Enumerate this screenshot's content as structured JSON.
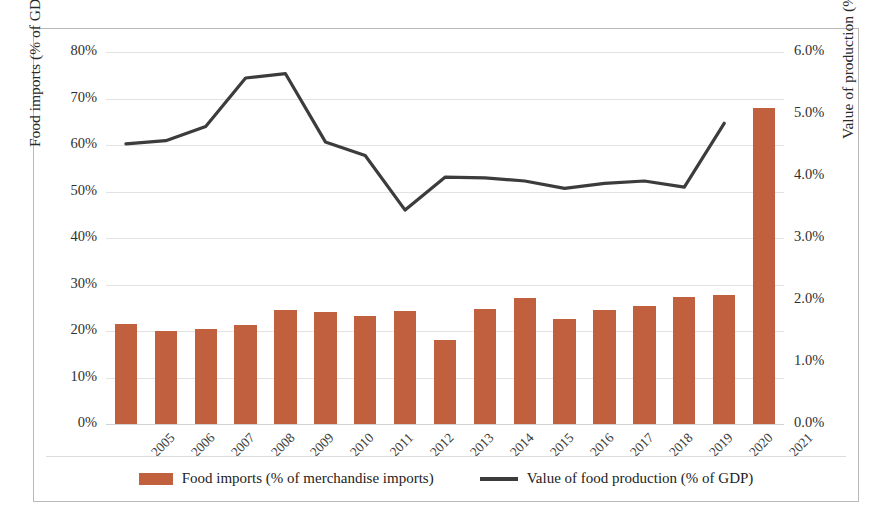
{
  "axes": {
    "y_left_title": "Food imports (% of GDP)",
    "y_right_title": "Value of production (% of GDP)",
    "y_left_ticks": [
      "0%",
      "10%",
      "20%",
      "30%",
      "40%",
      "50%",
      "60%",
      "70%",
      "80%"
    ],
    "y_right_ticks": [
      "0.0%",
      "1.0%",
      "2.0%",
      "3.0%",
      "4.0%",
      "5.0%",
      "6.0%"
    ]
  },
  "legend": {
    "items": [
      {
        "label": "Food imports (% of merchandise imports)",
        "marker": "bar-swatch",
        "color": "#c0603f"
      },
      {
        "label": "Value of food production (% of GDP)",
        "marker": "line-swatch",
        "color": "#3c3c3c"
      }
    ]
  },
  "colors": {
    "bar": "#c0603f",
    "line": "#3c3c3c",
    "grid": "#e2e2e2",
    "border": "#b9b9b9",
    "background": "#ffffff"
  },
  "chart_data": {
    "type": "bar",
    "title": "",
    "xlabel": "",
    "categories": [
      "2005",
      "2006",
      "2007",
      "2008",
      "2009",
      "2010",
      "2011",
      "2012",
      "2013",
      "2014",
      "2015",
      "2016",
      "2017",
      "2018",
      "2019",
      "2020",
      "2021"
    ],
    "grid": true,
    "legend_position": "bottom",
    "series": [
      {
        "name": "Food imports (% of merchandise imports)",
        "type": "bar",
        "axis": "left",
        "ylabel": "Food imports (% of GDP)",
        "ylim": [
          0,
          80
        ],
        "color": "#c0603f",
        "values": [
          21.5,
          20.0,
          20.5,
          21.3,
          24.5,
          24.0,
          23.2,
          24.2,
          18.0,
          24.7,
          27.0,
          22.5,
          24.6,
          25.3,
          27.3,
          27.8,
          68.0
        ]
      },
      {
        "name": "Value of food production (% of GDP)",
        "type": "line",
        "axis": "right",
        "ylabel": "Value of production (% of GDP)",
        "ylim": [
          0,
          6
        ],
        "color": "#3c3c3c",
        "values": [
          4.52,
          4.57,
          4.8,
          5.58,
          5.65,
          4.55,
          4.33,
          3.45,
          3.98,
          3.97,
          3.92,
          3.8,
          3.88,
          3.92,
          3.82,
          4.85,
          null
        ]
      }
    ]
  }
}
